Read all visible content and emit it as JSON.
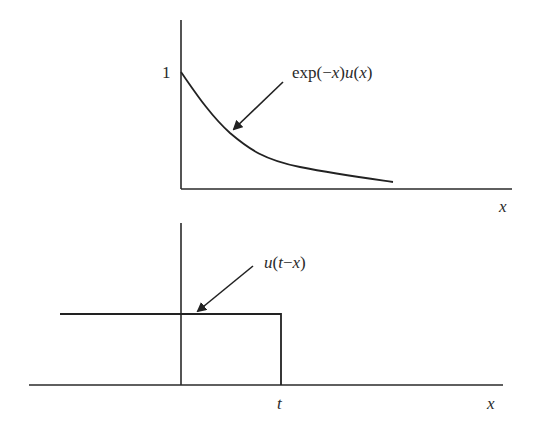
{
  "figure": {
    "top_panel": {
      "y_tick_label": "1",
      "x_axis_label": "x",
      "curve_label": "exp(−x)u(x)",
      "curve_label_parts": {
        "prefix": "exp(−",
        "var1": "x",
        "mid": ")",
        "func": "u",
        "open": "(",
        "var2": "x",
        "close": ")"
      },
      "function": "exp(-x)u(x)"
    },
    "bottom_panel": {
      "x_tick_label": "t",
      "x_axis_label": "x",
      "curve_label": "u(t−x)",
      "curve_label_parts": {
        "func": "u",
        "open": "(",
        "var1": "t",
        "minus": "−",
        "var2": "x",
        "close": ")"
      },
      "function": "u(t-x)"
    },
    "colors": {
      "ink": "#222222",
      "background": "#ffffff"
    }
  }
}
